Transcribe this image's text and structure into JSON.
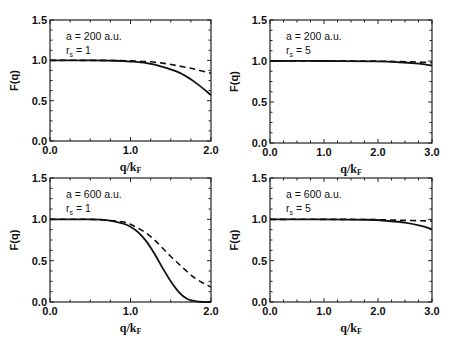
{
  "chart_data": [
    {
      "type": "line",
      "panel": "top-left",
      "annotation": [
        "a = 200 a.u.",
        "r_s = 1"
      ],
      "xlabel": "q/k_F",
      "ylabel": "F(q)",
      "xlim": [
        0,
        2
      ],
      "ylim": [
        0,
        1.5
      ],
      "xticks": [
        "0.0",
        "1.0",
        "2.0"
      ],
      "yticks": [
        "0.0",
        "0.5",
        "1.0",
        "1.5"
      ],
      "grid": false,
      "series": [
        {
          "name": "solid",
          "style": "solid",
          "x": [
            0,
            0.4,
            0.8,
            1.0,
            1.2,
            1.4,
            1.6,
            1.8,
            2.0
          ],
          "y": [
            1.0,
            1.0,
            0.995,
            0.985,
            0.965,
            0.92,
            0.85,
            0.73,
            0.57
          ]
        },
        {
          "name": "dashed",
          "style": "dashed",
          "x": [
            0,
            0.4,
            0.8,
            1.0,
            1.2,
            1.4,
            1.6,
            1.8,
            2.0
          ],
          "y": [
            1.0,
            1.0,
            0.998,
            0.993,
            0.985,
            0.965,
            0.93,
            0.89,
            0.84
          ]
        }
      ]
    },
    {
      "type": "line",
      "panel": "top-right",
      "annotation": [
        "a = 200 a.u.",
        "r_s = 5"
      ],
      "xlabel": "q/k_F",
      "ylabel": "F(q)",
      "xlim": [
        0,
        3
      ],
      "ylim": [
        0,
        1.5
      ],
      "xticks": [
        "0.0",
        "1.0",
        "2.0",
        "3.0"
      ],
      "yticks": [
        "0.0",
        "0.5",
        "1.0",
        "1.5"
      ],
      "grid": false,
      "series": [
        {
          "name": "solid",
          "style": "solid",
          "x": [
            0,
            1.0,
            2.0,
            2.4,
            2.7,
            3.0
          ],
          "y": [
            1.0,
            1.0,
            0.995,
            0.985,
            0.97,
            0.945
          ]
        },
        {
          "name": "dashed",
          "style": "dashed",
          "x": [
            0,
            1.0,
            2.0,
            2.4,
            2.7,
            3.0
          ],
          "y": [
            1.0,
            1.0,
            0.998,
            0.993,
            0.988,
            0.98
          ]
        }
      ]
    },
    {
      "type": "line",
      "panel": "bottom-left",
      "annotation": [
        "a = 600 a.u.",
        "r_s = 1"
      ],
      "xlabel": "q/k_F",
      "ylabel": "F(q)",
      "xlim": [
        0,
        2
      ],
      "ylim": [
        0,
        1.5
      ],
      "xticks": [
        "0.0",
        "1.0",
        "2.0"
      ],
      "yticks": [
        "0.0",
        "0.5",
        "1.0",
        "1.5"
      ],
      "grid": false,
      "series": [
        {
          "name": "solid",
          "style": "solid",
          "x": [
            0,
            0.5,
            0.7,
            0.9,
            1.0,
            1.1,
            1.2,
            1.3,
            1.4,
            1.5,
            1.6,
            1.7,
            1.8,
            1.9,
            2.0
          ],
          "y": [
            1.0,
            1.0,
            0.99,
            0.95,
            0.91,
            0.84,
            0.73,
            0.58,
            0.41,
            0.25,
            0.12,
            0.04,
            0.01,
            0.0,
            0.0
          ]
        },
        {
          "name": "dashed",
          "style": "dashed",
          "x": [
            0,
            0.5,
            0.7,
            0.9,
            1.0,
            1.1,
            1.2,
            1.3,
            1.4,
            1.5,
            1.6,
            1.7,
            1.8,
            1.9,
            2.0
          ],
          "y": [
            1.0,
            1.0,
            0.99,
            0.97,
            0.94,
            0.89,
            0.83,
            0.75,
            0.65,
            0.55,
            0.46,
            0.37,
            0.29,
            0.23,
            0.18
          ]
        }
      ]
    },
    {
      "type": "line",
      "panel": "bottom-right",
      "annotation": [
        "a = 600 a.u.",
        "r_s = 5"
      ],
      "xlabel": "q/k_F",
      "ylabel": "F(q)",
      "xlim": [
        0,
        3
      ],
      "ylim": [
        0,
        1.5
      ],
      "xticks": [
        "0.0",
        "1.0",
        "2.0",
        "3.0"
      ],
      "yticks": [
        "0.0",
        "0.5",
        "1.0",
        "1.5"
      ],
      "grid": false,
      "series": [
        {
          "name": "solid",
          "style": "solid",
          "x": [
            0,
            1.0,
            1.8,
            2.2,
            2.5,
            2.8,
            3.0
          ],
          "y": [
            1.0,
            1.0,
            0.995,
            0.98,
            0.96,
            0.92,
            0.88
          ]
        },
        {
          "name": "dashed",
          "style": "dashed",
          "x": [
            0,
            1.0,
            1.8,
            2.2,
            2.5,
            2.8,
            3.0
          ],
          "y": [
            1.0,
            1.0,
            0.998,
            0.993,
            0.988,
            0.983,
            0.98
          ]
        }
      ]
    }
  ],
  "colors": {
    "line": "#111111",
    "axis": "#222222",
    "background": "#ffffff"
  }
}
